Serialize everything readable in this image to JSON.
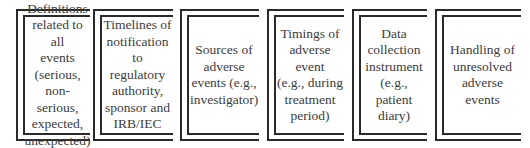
{
  "diagram": {
    "type": "row-of-framed-boxes",
    "line_color": "#2a2a2a",
    "text_color": "#3c3c3c",
    "boxes": [
      {
        "label": "Definitions\nrelated to all\nevents\n(serious,\nnon-serious,\nexpected,\nunexpected)"
      },
      {
        "label": "Timelines of\nnotification\nto regulatory\nauthority,\nsponsor and\nIRB/IEC"
      },
      {
        "label": "Sources of\nadverse\nevents (e.g.,\ninvestigator)"
      },
      {
        "label": "Timings of\nadverse event\n(e.g., during\ntreatment\nperiod)"
      },
      {
        "label": "Data\ncollection\ninstrument\n(e.g., patient\ndiary)"
      },
      {
        "label": "Handling of\nunresolved\nadverse\nevents"
      }
    ]
  }
}
